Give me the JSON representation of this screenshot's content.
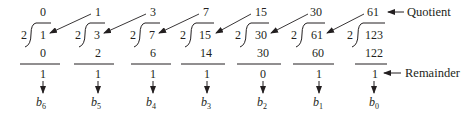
{
  "figure": {
    "divisor": "2",
    "steps": [
      {
        "quotient": "0",
        "dividend": "1",
        "product": "0",
        "remainder": "1",
        "bit": "b",
        "bit_sub": "6"
      },
      {
        "quotient": "1",
        "dividend": "3",
        "product": "2",
        "remainder": "1",
        "bit": "b",
        "bit_sub": "5"
      },
      {
        "quotient": "3",
        "dividend": "7",
        "product": "6",
        "remainder": "1",
        "bit": "b",
        "bit_sub": "4"
      },
      {
        "quotient": "7",
        "dividend": "15",
        "product": "14",
        "remainder": "1",
        "bit": "b",
        "bit_sub": "3"
      },
      {
        "quotient": "15",
        "dividend": "30",
        "product": "30",
        "remainder": "0",
        "bit": "b",
        "bit_sub": "2"
      },
      {
        "quotient": "30",
        "dividend": "61",
        "product": "60",
        "remainder": "1",
        "bit": "b",
        "bit_sub": "1"
      },
      {
        "quotient": "61",
        "dividend": "123",
        "product": "122",
        "remainder": "1",
        "bit": "b",
        "bit_sub": "0"
      }
    ],
    "labels": {
      "quotient": "Quotient",
      "remainder": "Remainder"
    },
    "colors": {
      "ink": "#231f20",
      "background": "#ffffff"
    }
  }
}
